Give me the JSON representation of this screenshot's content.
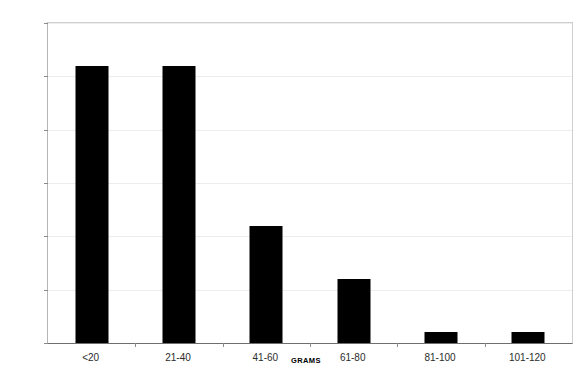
{
  "chart_data": {
    "type": "bar",
    "title": "",
    "subtitle": "",
    "categories": [
      "<20",
      "21-40",
      "41-60",
      "61-80",
      "81-100",
      "101-120"
    ],
    "values": [
      26,
      26,
      11,
      6,
      1,
      1
    ],
    "xlabel": "GRAMS",
    "ylabel": "NO OF AXES",
    "ylim": [
      0,
      30
    ],
    "yticks": [
      0,
      5,
      10,
      15,
      20,
      25,
      30
    ],
    "ytick_labels": [
      "0",
      "5",
      "10",
      "15",
      "20",
      "25",
      "30"
    ],
    "grid": true,
    "grid_axis": "y",
    "legend": false,
    "legend_position": "none",
    "bar_color": "#000000",
    "background_color": "#ffffff",
    "gridline_color": "#ededed",
    "axis_color": "#6e6e6e",
    "orientation": "vertical"
  }
}
